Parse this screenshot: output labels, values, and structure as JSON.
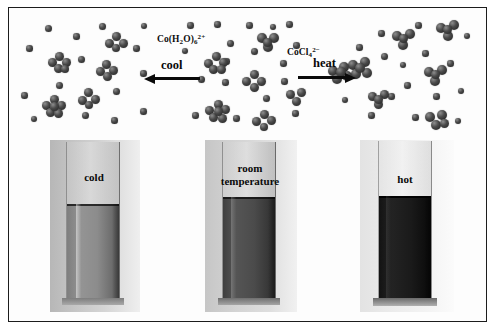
{
  "figure": {
    "frame_color": "#1c1c1c",
    "background": "#ffffff"
  },
  "molecular_region": {
    "species_labels": [
      {
        "name": "hexaaquacobalt-label",
        "text": "Co(H2O)6 2+",
        "formula_parts": [
          "Co(H",
          "2",
          "O)",
          "6",
          "2+"
        ],
        "x": 157,
        "y": 33
      },
      {
        "name": "tetrachlorocobaltate-label",
        "text": "CoCl4 2-",
        "formula_parts": [
          "CoCl",
          "4",
          "2−"
        ],
        "x": 271,
        "y": 46
      }
    ],
    "arrows": [
      {
        "name": "cool-arrow",
        "label": "cool",
        "direction": "left",
        "x": 144,
        "y": 74,
        "width": 56,
        "label_x": 159,
        "label_y": 58
      },
      {
        "name": "heat-arrow",
        "label": "heat",
        "direction": "right",
        "x": 298,
        "y": 74,
        "width": 58,
        "label_x": 311,
        "label_y": 57
      }
    ],
    "panels": [
      {
        "name": "cool-panel-molecules",
        "description": "left panel: mostly pink hexaaqua species, many single spheres and some octahedral clusters"
      },
      {
        "name": "room-temperature-panel-molecules",
        "description": "middle panel: mixture of both species"
      },
      {
        "name": "heat-panel-molecules",
        "description": "right panel: more tetrahedral CoCl4 clusters"
      }
    ]
  },
  "tubes": [
    {
      "name": "cold-test-tube",
      "label": "cold",
      "liquid_color": "#8a8a8a",
      "liquid_color_bottom": "#6d6d6d",
      "background_color": "#c9c9c9",
      "x": 66,
      "y": 142,
      "width": 54,
      "height": 160,
      "fill_ratio": 0.62,
      "label_x": 78,
      "label_y": 172
    },
    {
      "name": "room-temperature-test-tube",
      "label": "room\ntemperature",
      "liquid_color": "#4a4a4a",
      "liquid_color_bottom": "#3b3b3b",
      "background_color": "#cfcfcf",
      "x": 222,
      "y": 142,
      "width": 54,
      "height": 160,
      "fill_ratio": 0.66,
      "label_x": 213,
      "label_y": 164
    },
    {
      "name": "hot-test-tube",
      "label": "hot",
      "liquid_color": "#1a1a1a",
      "liquid_color_bottom": "#111111",
      "background_color": "#e6e6e6",
      "x": 378,
      "y": 142,
      "width": 54,
      "height": 160,
      "fill_ratio": 0.66,
      "label_x": 392,
      "label_y": 174
    }
  ]
}
